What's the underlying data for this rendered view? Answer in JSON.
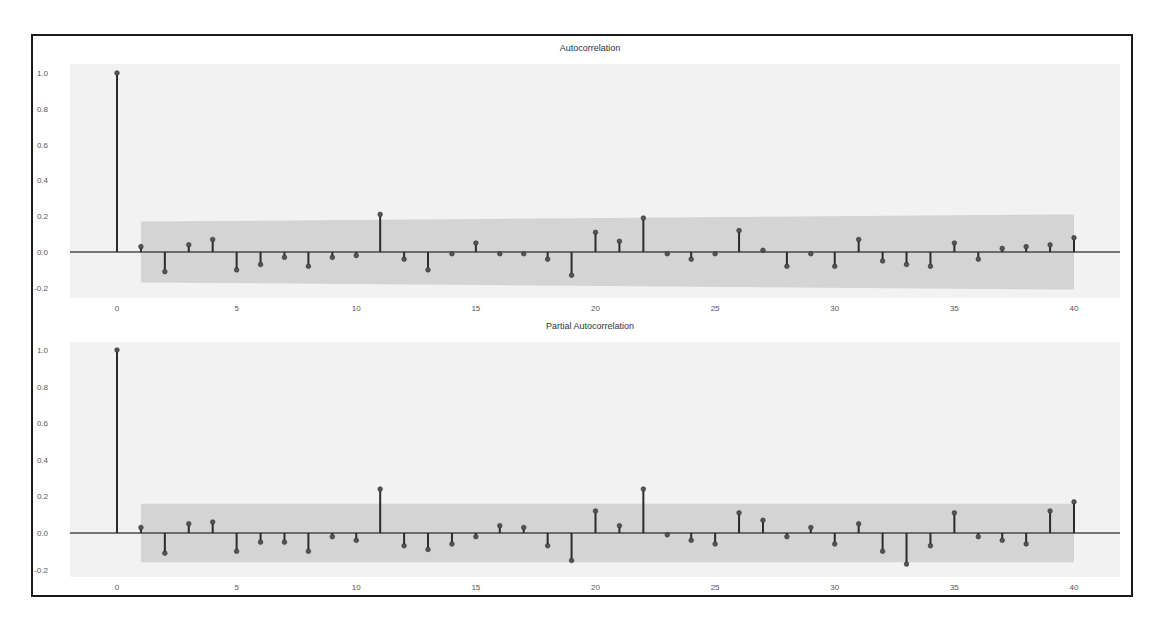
{
  "figure": {
    "panels": [
      {
        "title": "Autocorrelation"
      },
      {
        "title": "Partial Autocorrelation"
      }
    ]
  },
  "colors": {
    "plot_background": "#f2f2f2",
    "confidence_band": "#d4d4d4",
    "stem": "#2b2b2b",
    "marker": "#555555",
    "baseline": "#4a4a4a",
    "frame": "#1a1a1a",
    "tick_text": "#555555"
  },
  "chart_data": [
    {
      "type": "stem",
      "title": "Autocorrelation",
      "xlabel": "",
      "ylabel": "",
      "xlim": [
        -2,
        42
      ],
      "ylim": [
        -0.25,
        1.05
      ],
      "xticks": [
        0,
        5,
        10,
        15,
        20,
        25,
        30,
        35,
        40
      ],
      "yticks": [
        "-0.2",
        "0.0",
        "0.2",
        "0.4",
        "0.6",
        "0.8",
        "1.0"
      ],
      "grid": false,
      "confidence_band": {
        "from_lag": 1,
        "to_lag": 40,
        "lower_start": -0.17,
        "upper_start": 0.17,
        "lower_end": -0.21,
        "upper_end": 0.21
      },
      "x": [
        0,
        1,
        2,
        3,
        4,
        5,
        6,
        7,
        8,
        9,
        10,
        11,
        12,
        13,
        14,
        15,
        16,
        17,
        18,
        19,
        20,
        21,
        22,
        23,
        24,
        25,
        26,
        27,
        28,
        29,
        30,
        31,
        32,
        33,
        34,
        35,
        36,
        37,
        38,
        39,
        40
      ],
      "values": [
        1.0,
        0.03,
        -0.11,
        0.04,
        0.07,
        -0.1,
        -0.07,
        -0.03,
        -0.08,
        -0.03,
        -0.02,
        0.21,
        -0.04,
        -0.1,
        -0.01,
        0.05,
        -0.01,
        -0.01,
        -0.04,
        -0.13,
        0.11,
        0.06,
        0.19,
        -0.01,
        -0.04,
        -0.01,
        0.12,
        0.01,
        -0.08,
        -0.01,
        -0.08,
        0.07,
        -0.05,
        -0.07,
        -0.08,
        0.05,
        -0.04,
        0.02,
        0.03,
        0.04,
        0.08
      ]
    },
    {
      "type": "stem",
      "title": "Partial Autocorrelation",
      "xlabel": "",
      "ylabel": "",
      "xlim": [
        -2,
        42
      ],
      "ylim": [
        -0.25,
        1.05
      ],
      "xticks": [
        0,
        5,
        10,
        15,
        20,
        25,
        30,
        35,
        40
      ],
      "yticks": [
        "-0.2",
        "0.0",
        "0.2",
        "0.4",
        "0.6",
        "0.8",
        "1.0"
      ],
      "grid": false,
      "confidence_band": {
        "from_lag": 1,
        "to_lag": 40,
        "lower_start": -0.16,
        "upper_start": 0.16,
        "lower_end": -0.16,
        "upper_end": 0.16
      },
      "x": [
        0,
        1,
        2,
        3,
        4,
        5,
        6,
        7,
        8,
        9,
        10,
        11,
        12,
        13,
        14,
        15,
        16,
        17,
        18,
        19,
        20,
        21,
        22,
        23,
        24,
        25,
        26,
        27,
        28,
        29,
        30,
        31,
        32,
        33,
        34,
        35,
        36,
        37,
        38,
        39,
        40
      ],
      "values": [
        1.0,
        0.03,
        -0.11,
        0.05,
        0.06,
        -0.1,
        -0.05,
        -0.05,
        -0.1,
        -0.02,
        -0.04,
        0.24,
        -0.07,
        -0.09,
        -0.06,
        -0.02,
        0.04,
        0.03,
        -0.07,
        -0.15,
        0.12,
        0.04,
        0.24,
        -0.01,
        -0.04,
        -0.06,
        0.11,
        0.07,
        -0.02,
        0.03,
        -0.06,
        0.05,
        -0.1,
        -0.17,
        -0.07,
        0.11,
        -0.02,
        -0.04,
        -0.06,
        0.12,
        0.17
      ]
    }
  ]
}
